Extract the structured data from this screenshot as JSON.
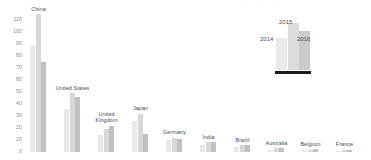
{
  "chart_data": {
    "type": "bar",
    "title": "",
    "xlabel": "",
    "ylabel": "",
    "ylim": [
      0,
      110
    ],
    "grid": false,
    "legend_position": "top-right",
    "categories": [
      "China",
      "United States",
      "United Kingdom",
      "Japan",
      "Germany",
      "India",
      "Brazil",
      "Australia",
      "Belgium",
      "France"
    ],
    "series": [
      {
        "name": "2014",
        "values": [
          88,
          36,
          14,
          26,
          10,
          6,
          4,
          2,
          1.5,
          1
        ]
      },
      {
        "name": "2015",
        "values": [
          115,
          49,
          19,
          32,
          12,
          8,
          6,
          3,
          2,
          1.5
        ]
      },
      {
        "name": "2016",
        "values": [
          75,
          46,
          22,
          15,
          11,
          8,
          6,
          3,
          2.5,
          2
        ]
      }
    ],
    "ytick_labels": [
      "0",
      "10",
      "20",
      "30",
      "40",
      "50",
      "60",
      "70",
      "80",
      "90",
      "100",
      "110"
    ],
    "ytick_values": [
      0,
      10,
      20,
      30,
      40,
      50,
      60,
      70,
      80,
      90,
      100,
      110
    ],
    "colors": {
      "series_2014": "#e9e9ea",
      "series_2015": "#d6d7d8",
      "series_2016": "#bfc0c2",
      "legend_underline": "#1b1b1b",
      "tick_text": "#8a8a8a",
      "label_text": "#4a4a4a",
      "background": "#ffffff"
    }
  },
  "legend": {
    "labels": [
      "2014",
      "2015",
      "2016"
    ]
  },
  "header_strip": {
    "text": "· · · ·    · ·    · · · · ·    · · · ·  · ·"
  }
}
